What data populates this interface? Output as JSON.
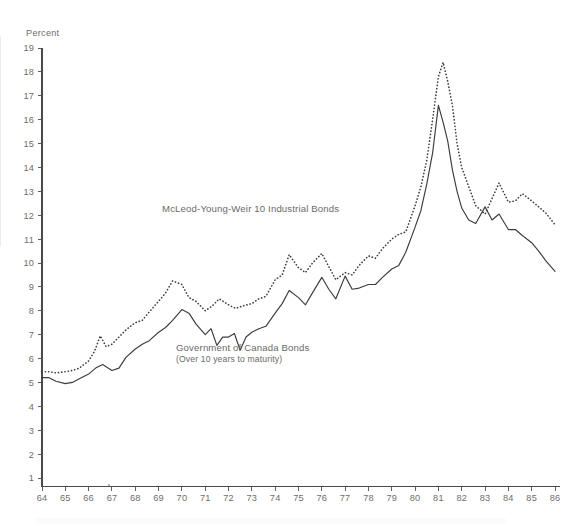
{
  "chart_data": {
    "type": "line",
    "title": "",
    "xlabel": "",
    "ylabel": "Percent",
    "ylim": [
      0,
      19
    ],
    "xlim": [
      64,
      86
    ],
    "grid": false,
    "legend_position": "inline-annotations",
    "y_ticks": [
      19,
      18,
      17,
      16,
      15,
      14,
      13,
      12,
      11,
      10,
      9,
      8,
      7,
      6,
      5,
      4,
      3,
      2,
      1
    ],
    "x_ticks": [
      64,
      65,
      66,
      67,
      68,
      69,
      70,
      71,
      72,
      73,
      74,
      75,
      76,
      77,
      78,
      79,
      80,
      81,
      82,
      83,
      84,
      85,
      86
    ],
    "series": [
      {
        "name": "McLeod-Young-Weir 10 Industrial Bonds",
        "style": "dotted",
        "color": "#3c3c3c",
        "x": [
          64.0,
          64.3,
          64.6,
          65.0,
          65.3,
          65.6,
          66.0,
          66.25,
          66.5,
          66.75,
          67.0,
          67.3,
          67.6,
          68.0,
          68.3,
          68.6,
          69.0,
          69.3,
          69.6,
          70.0,
          70.3,
          70.6,
          71.0,
          71.3,
          71.6,
          72.0,
          72.3,
          72.6,
          73.0,
          73.3,
          73.6,
          74.0,
          74.3,
          74.6,
          75.0,
          75.3,
          75.6,
          76.0,
          76.3,
          76.6,
          77.0,
          77.3,
          77.6,
          78.0,
          78.3,
          78.6,
          79.0,
          79.3,
          79.6,
          80.0,
          80.25,
          80.5,
          80.75,
          81.0,
          81.2,
          81.4,
          81.6,
          81.8,
          82.0,
          82.3,
          82.6,
          83.0,
          83.3,
          83.6,
          84.0,
          84.3,
          84.6,
          85.0,
          85.3,
          85.6,
          86.0
        ],
        "y": [
          5.45,
          5.45,
          5.4,
          5.45,
          5.5,
          5.6,
          5.9,
          6.3,
          6.95,
          6.5,
          6.6,
          6.9,
          7.2,
          7.5,
          7.6,
          7.95,
          8.4,
          8.75,
          9.25,
          9.1,
          8.55,
          8.4,
          8.0,
          8.2,
          8.5,
          8.25,
          8.1,
          8.2,
          8.3,
          8.5,
          8.6,
          9.3,
          9.5,
          10.35,
          9.8,
          9.6,
          10.0,
          10.4,
          9.85,
          9.3,
          9.6,
          9.5,
          9.9,
          10.3,
          10.2,
          10.6,
          11.0,
          11.2,
          11.3,
          12.4,
          13.2,
          14.3,
          16.0,
          17.8,
          18.4,
          17.6,
          16.6,
          15.0,
          14.0,
          13.2,
          12.4,
          12.05,
          12.7,
          13.35,
          12.55,
          12.6,
          12.9,
          12.6,
          12.35,
          12.1,
          11.6
        ]
      },
      {
        "name": "Government of Canada Bonds (Over 10 years to maturity)",
        "style": "solid",
        "color": "#3c3c3c",
        "x": [
          64.0,
          64.3,
          64.6,
          65.0,
          65.3,
          65.6,
          66.0,
          66.3,
          66.6,
          67.0,
          67.3,
          67.6,
          68.0,
          68.3,
          68.6,
          69.0,
          69.3,
          69.6,
          70.0,
          70.3,
          70.6,
          71.0,
          71.25,
          71.5,
          71.75,
          72.0,
          72.25,
          72.5,
          72.75,
          73.0,
          73.3,
          73.6,
          74.0,
          74.3,
          74.6,
          75.0,
          75.3,
          75.6,
          76.0,
          76.3,
          76.6,
          77.0,
          77.3,
          77.6,
          78.0,
          78.3,
          78.6,
          79.0,
          79.3,
          79.6,
          80.0,
          80.25,
          80.5,
          80.75,
          81.0,
          81.2,
          81.4,
          81.6,
          81.8,
          82.0,
          82.3,
          82.6,
          83.0,
          83.3,
          83.6,
          84.0,
          84.3,
          84.6,
          85.0,
          85.3,
          85.6,
          86.0
        ],
        "y": [
          5.2,
          5.2,
          5.05,
          4.95,
          5.0,
          5.15,
          5.35,
          5.6,
          5.75,
          5.5,
          5.6,
          6.05,
          6.4,
          6.6,
          6.75,
          7.1,
          7.3,
          7.6,
          8.05,
          7.9,
          7.45,
          7.0,
          7.25,
          6.55,
          6.9,
          6.9,
          7.05,
          6.35,
          6.9,
          7.1,
          7.25,
          7.35,
          7.9,
          8.3,
          8.85,
          8.55,
          8.25,
          8.75,
          9.4,
          8.9,
          8.5,
          9.45,
          8.9,
          8.95,
          9.1,
          9.1,
          9.4,
          9.75,
          9.9,
          10.45,
          11.5,
          12.2,
          13.3,
          14.6,
          16.6,
          15.9,
          15.1,
          13.9,
          13.0,
          12.3,
          11.8,
          11.65,
          12.35,
          11.8,
          12.05,
          11.4,
          11.4,
          11.15,
          10.85,
          10.5,
          10.1,
          9.65
        ]
      }
    ],
    "annotations": [
      {
        "name": "industrial-bonds-label",
        "text": "McLeod-Young-Weir 10 Industrial Bonds",
        "subtext": ""
      },
      {
        "name": "canada-bonds-label",
        "text": "Government of Canada Bonds",
        "subtext": "(Over 10 years to maturity)"
      }
    ]
  },
  "axis": {
    "unit_label": "Percent"
  }
}
